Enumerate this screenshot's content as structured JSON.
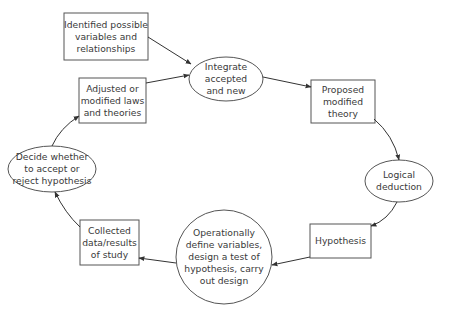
{
  "diagram": {
    "type": "cycle-flowchart",
    "colors": {
      "stroke": "#555555",
      "text": "#3a3a3a",
      "background": "#ffffff"
    },
    "nodes": [
      {
        "id": "identified",
        "shape": "rectangle",
        "label": "Identified possible\nvariables and\nrelationships"
      },
      {
        "id": "adjusted",
        "shape": "rectangle",
        "label": "Adjusted or\nmodified laws\nand theories"
      },
      {
        "id": "integrate",
        "shape": "ellipse",
        "label": "Integrate\naccepted\nand new"
      },
      {
        "id": "proposed",
        "shape": "rectangle",
        "label": "Proposed\nmodified\ntheory"
      },
      {
        "id": "logical",
        "shape": "ellipse",
        "label": "Logical\ndeduction"
      },
      {
        "id": "hypothesis",
        "shape": "rectangle",
        "label": "Hypothesis"
      },
      {
        "id": "operationally",
        "shape": "ellipse",
        "label": "Operationally\ndefine variables,\ndesign a test of\nhypothesis, carry\nout design"
      },
      {
        "id": "collected",
        "shape": "rectangle",
        "label": "Collected\ndata/results\nof study"
      },
      {
        "id": "decide",
        "shape": "ellipse",
        "label": "Decide whether\nto accept or\nreject hypothesis"
      }
    ],
    "edges": [
      {
        "from": "identified",
        "to": "integrate"
      },
      {
        "from": "adjusted",
        "to": "integrate"
      },
      {
        "from": "integrate",
        "to": "proposed"
      },
      {
        "from": "proposed",
        "to": "logical"
      },
      {
        "from": "logical",
        "to": "hypothesis"
      },
      {
        "from": "hypothesis",
        "to": "operationally"
      },
      {
        "from": "operationally",
        "to": "collected"
      },
      {
        "from": "collected",
        "to": "decide"
      },
      {
        "from": "decide",
        "to": "adjusted"
      }
    ]
  }
}
